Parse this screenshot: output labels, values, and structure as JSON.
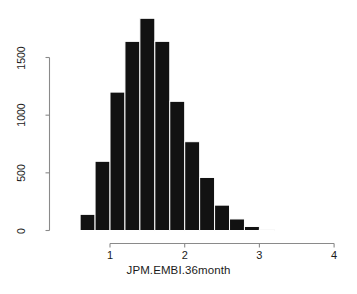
{
  "chart_data": {
    "type": "bar",
    "title": "",
    "subtitle": "",
    "xlabel": "JPM.EMBI.36month",
    "ylabel": "",
    "grid": false,
    "legend": false,
    "legend_position": "none",
    "bar_color": "#121212",
    "bar_border_color": "#ffffff",
    "axis_color": "#8a8a8a",
    "bin_width": 0.2,
    "xlim": [
      0.6,
      4.0
    ],
    "ylim": [
      0,
      1500
    ],
    "x_axis_range_drawn": [
      1,
      4
    ],
    "y_axis_range_drawn": [
      0,
      1500
    ],
    "xticks": [
      1,
      2,
      3,
      4
    ],
    "xtick_labels": [
      "1",
      "2",
      "3",
      "4"
    ],
    "yticks": [
      0,
      500,
      1000,
      1500
    ],
    "ytick_labels": [
      "0",
      "500",
      "1000",
      "1500"
    ],
    "bins": [
      {
        "x0": 0.6,
        "x1": 0.8,
        "count": 140
      },
      {
        "x0": 0.8,
        "x1": 1.0,
        "count": 600
      },
      {
        "x0": 1.0,
        "x1": 1.2,
        "count": 1200
      },
      {
        "x0": 1.2,
        "x1": 1.4,
        "count": 1640
      },
      {
        "x0": 1.4,
        "x1": 1.6,
        "count": 1840
      },
      {
        "x0": 1.6,
        "x1": 1.8,
        "count": 1640
      },
      {
        "x0": 1.8,
        "x1": 2.0,
        "count": 1120
      },
      {
        "x0": 2.0,
        "x1": 2.2,
        "count": 770
      },
      {
        "x0": 2.2,
        "x1": 2.4,
        "count": 460
      },
      {
        "x0": 2.4,
        "x1": 2.6,
        "count": 220
      },
      {
        "x0": 2.6,
        "x1": 2.8,
        "count": 100
      },
      {
        "x0": 2.8,
        "x1": 3.0,
        "count": 35
      },
      {
        "x0": 3.0,
        "x1": 3.2,
        "count": 8
      }
    ],
    "categories": [
      "0.6-0.8",
      "0.8-1.0",
      "1.0-1.2",
      "1.2-1.4",
      "1.4-1.6",
      "1.6-1.8",
      "1.8-2.0",
      "2.0-2.2",
      "2.2-2.4",
      "2.4-2.6",
      "2.6-2.8",
      "2.8-3.0",
      "3.0-3.2"
    ],
    "values": [
      140,
      600,
      1200,
      1640,
      1840,
      1640,
      1120,
      770,
      460,
      220,
      100,
      35,
      8
    ]
  }
}
